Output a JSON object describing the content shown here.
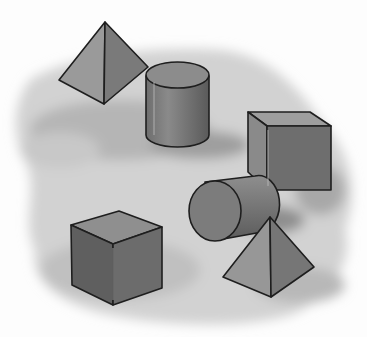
{
  "image": {
    "description": "Grayscale illustration of 3D geometric solids on a mottled shadowed ground",
    "palette": {
      "background": "#fdfdfd",
      "ground_light": "#d4d4d4",
      "ground_dark": "#9a9a9a",
      "outline": "#1e1e1e",
      "face_light": "#9c9c9c",
      "face_mid": "#7e7e7e",
      "face_dark": "#5f5f5f"
    },
    "shapes": [
      {
        "name": "pyramid",
        "position": "top-left"
      },
      {
        "name": "cylinder-upright",
        "position": "top-center"
      },
      {
        "name": "cube",
        "position": "right"
      },
      {
        "name": "cylinder-lying",
        "position": "center-right"
      },
      {
        "name": "cube",
        "position": "bottom-left"
      },
      {
        "name": "pyramid",
        "position": "bottom-right"
      }
    ]
  }
}
